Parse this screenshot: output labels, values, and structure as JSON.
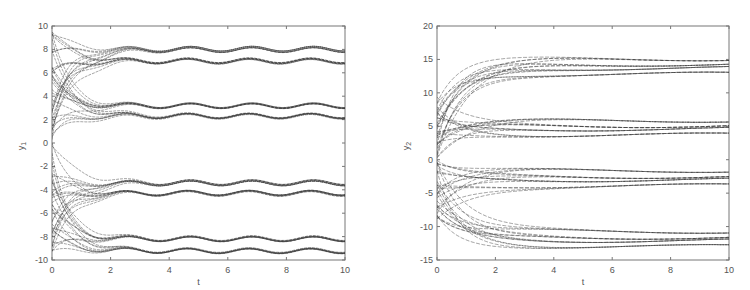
{
  "chart_data": [
    {
      "type": "line",
      "title": "",
      "xlabel": "t",
      "ylabel": "y_1",
      "xlim": [
        0,
        10
      ],
      "ylim": [
        -10,
        10
      ],
      "xticks": [
        0,
        2,
        4,
        6,
        8,
        10
      ],
      "yticks": [
        10,
        8,
        6,
        4,
        2,
        0,
        -2,
        -4,
        -6,
        -8,
        -10
      ],
      "grid": false,
      "legend": null,
      "description": "Many trajectories starting in [-10,10] at t=0 converge by t~2 into 8 oscillating clusters (pairs near 8/7, 3.2/2.3, -3.4/-4.3, -8.2/-9.2) with small sinusoidal oscillation (amplitude ~0.2, period ~2.1).",
      "clusters": [
        {
          "center": 8.0,
          "amplitude": 0.2
        },
        {
          "center": 7.0,
          "amplitude": 0.2
        },
        {
          "center": 3.2,
          "amplitude": 0.2
        },
        {
          "center": 2.3,
          "amplitude": 0.2
        },
        {
          "center": -3.4,
          "amplitude": 0.2
        },
        {
          "center": -4.3,
          "amplitude": 0.2
        },
        {
          "center": -8.2,
          "amplitude": 0.2
        },
        {
          "center": -9.2,
          "amplitude": 0.2
        }
      ],
      "oscillation_period": 2.1,
      "convergence_time": 2
    },
    {
      "type": "line",
      "title": "",
      "xlabel": "t",
      "ylabel": "y_2",
      "xlim": [
        0,
        10
      ],
      "ylim": [
        -15,
        20
      ],
      "xticks": [
        0,
        2,
        4,
        6,
        8,
        10
      ],
      "yticks": [
        20,
        15,
        10,
        5,
        0,
        -5,
        -10,
        -15
      ],
      "grid": false,
      "legend": null,
      "description": "Many trajectories starting in about [-10,10] at t=0 converge by t~3 into 4 bands of slowly varying dashed curves: ~12.7 to 15.2, ~3.7 to 6.0, ~-1.5 to -4.0, ~-10.5 to -13.",
      "bands": [
        {
          "levels": [
            15.1,
            14.3,
            13.7,
            12.8
          ]
        },
        {
          "levels": [
            5.9,
            5.1,
            4.6,
            3.7
          ]
        },
        {
          "levels": [
            -1.6,
            -2.5,
            -3.0,
            -3.9
          ]
        },
        {
          "levels": [
            -10.7,
            -11.6,
            -12.1,
            -13.0
          ]
        }
      ],
      "convergence_time": 3
    }
  ],
  "panels": {
    "left": {
      "xlabel": "t",
      "ylabel_main": "y",
      "ylabel_sub": "1"
    },
    "right": {
      "xlabel": "t",
      "ylabel_main": "y",
      "ylabel_sub": "2"
    }
  }
}
